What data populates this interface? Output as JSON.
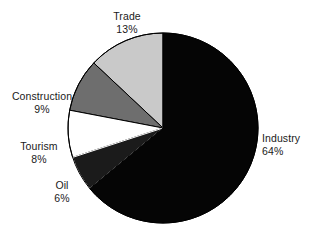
{
  "chart_data": {
    "type": "pie",
    "title": "",
    "subtitle": "",
    "xlabel": "",
    "ylabel": "",
    "legend_position": "none",
    "grid": false,
    "unit": "%",
    "total": 100,
    "start_angle_deg": 0,
    "direction": "counterclockwise",
    "categories": [
      "Trade",
      "Construction",
      "Tourism",
      "Oil",
      "Industry"
    ],
    "values": [
      13,
      9,
      8,
      6,
      64
    ],
    "slices": [
      {
        "name": "Trade",
        "value": 13,
        "value_label": "13%",
        "color": "#c9c9c9",
        "stroke": "#000000"
      },
      {
        "name": "Construction",
        "value": 9,
        "value_label": "9%",
        "color": "#6e6e6e",
        "stroke": "#000000"
      },
      {
        "name": "Tourism",
        "value": 8,
        "value_label": "8%",
        "color": "#ffffff",
        "stroke": "#000000"
      },
      {
        "name": "Oil",
        "value": 6,
        "value_label": "6%",
        "color": "#1b1b1b",
        "stroke": "#ffffff"
      },
      {
        "name": "Industry",
        "value": 64,
        "value_label": "64%",
        "color": "#050505",
        "stroke": "#000000"
      }
    ],
    "colors": {
      "background": "#ffffff",
      "text": "#1a1a1a",
      "outline": "#000000",
      "trade": "#c9c9c9",
      "construction": "#6e6e6e",
      "tourism": "#ffffff",
      "oil": "#1b1b1b",
      "industry": "#050505"
    },
    "geometry": {
      "center_x": 163,
      "center_y": 128,
      "radius": 95
    }
  },
  "labels": {
    "trade": {
      "name": "Trade",
      "value": "13%"
    },
    "construction": {
      "name": "Construction",
      "value": "9%"
    },
    "tourism": {
      "name": "Tourism",
      "value": "8%"
    },
    "oil": {
      "name": "Oil",
      "value": "6%"
    },
    "industry": {
      "name": "Industry",
      "value": "64%"
    }
  }
}
